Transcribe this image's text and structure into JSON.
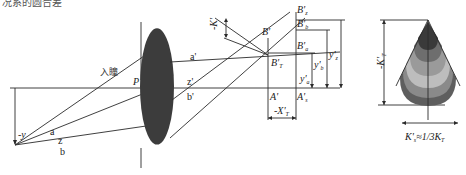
{
  "top_text": "况系的圆合差",
  "pupil_label": "入瞳",
  "point_labels": {
    "P": "P",
    "a": "a",
    "z": "z",
    "b": "b",
    "a_prime": "a'",
    "z_prime": "z'",
    "b_prime": "b'",
    "neg_y": "-y",
    "B_prime": "B'",
    "B_prime_T": "B'",
    "B_prime_T_sub": "T",
    "B_prime_z": "B'",
    "B_prime_z_sub": "z",
    "B_prime_b": "B'",
    "B_prime_b_sub": "b",
    "B_prime_a": "B'",
    "B_prime_a_sub": "a",
    "A_prime": "A'",
    "A_prime_s": "A'",
    "A_prime_s_sub": "s",
    "neg_X_prime_T": "-X'",
    "neg_X_prime_T_sub": "T",
    "neg_K_prime": "-K'",
    "y_prime_a": "y'",
    "y_prime_a_sub": "a",
    "y_prime_b": "y'",
    "y_prime_b_sub": "b",
    "y_prime_z": "y'",
    "y_prime_z_sub": "z"
  },
  "coma_figure": {
    "neg_K_prime_T": "-K'",
    "neg_K_prime_T_sub": "T",
    "relation": "K'",
    "relation_sub": "s",
    "relation_rest": "≈1/3K",
    "relation_rest_sub": "T",
    "band_colors": [
      "#3a3a3a",
      "#6e6e6e",
      "#9a9a9a",
      "#bdbdbd",
      "#8a8a8a",
      "#5e5e5e"
    ]
  },
  "colors": {
    "line": "#2a2a2a",
    "lens": "#3c3c3c"
  }
}
